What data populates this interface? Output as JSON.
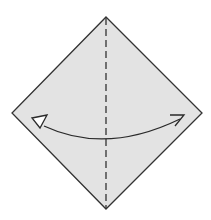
{
  "diagram": {
    "type": "origami-step",
    "colors": {
      "paper": "#e3e3e3",
      "edge": "#333333",
      "crease": "#333333",
      "arrow": "#2a2a2a",
      "background": "#ffffff"
    },
    "paper": {
      "shape": "diamond",
      "vertices": {
        "top": [
          106,
          17
        ],
        "right": [
          202,
          113
        ],
        "bottom": [
          106,
          209
        ],
        "left": [
          12,
          113
        ]
      }
    },
    "crease": {
      "style": "dashed",
      "kind": "valley-fold",
      "from": [
        106,
        17
      ],
      "to": [
        106,
        209
      ]
    },
    "arrow": {
      "kind": "fold-and-unfold",
      "start": [
        186,
        115
      ],
      "end": [
        32,
        118
      ],
      "heads": [
        "open-hollow-left",
        "barbed-right"
      ]
    }
  }
}
